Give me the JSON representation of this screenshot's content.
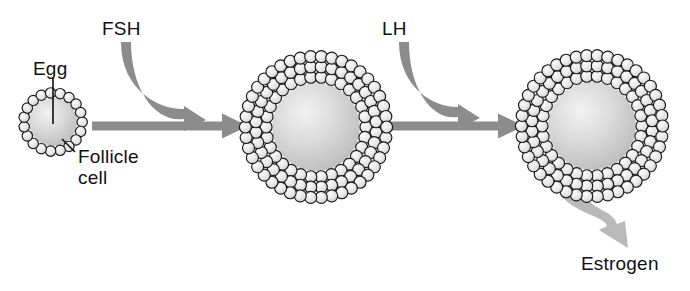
{
  "diagram": {
    "background_color": "#ffffff",
    "text_color": "#111111",
    "arrow_color": "#8c8c8c",
    "hormone_arrow_color": "#8c8c8c",
    "secretion_arrow_color": "#b9b9b9",
    "cell_fill_color": "#e9e9e9",
    "cell_stroke_color": "#1a1a1a",
    "egg_fill_color": "#d2d2d2",
    "labels": {
      "egg": "Egg",
      "fsh": "FSH",
      "lh": "LH",
      "follicle_cell_line1": "Follicle",
      "follicle_cell_line2": "cell",
      "estrogen": "Estrogen"
    },
    "stages": [
      {
        "name": "primary-follicle",
        "center_x": 53,
        "center_y": 122,
        "oocyte_radius": 24,
        "cell_rings": 1,
        "cells_per_ring": 19,
        "cell_radius": 5.2
      },
      {
        "name": "growing-follicle",
        "center_x": 316,
        "center_y": 127,
        "oocyte_radius": 44,
        "cell_rings": 3,
        "cells_per_ring": 30,
        "cell_radius": 6.0
      },
      {
        "name": "mature-follicle",
        "center_x": 592,
        "center_y": 126,
        "oocyte_radius": 44,
        "cell_rings": 3,
        "cells_per_ring": 30,
        "cell_radius": 6.0
      }
    ],
    "flow_arrows": [
      {
        "name": "stage1-to-stage2",
        "from_x": 92,
        "to_x": 248,
        "y": 126
      },
      {
        "name": "stage2-to-stage3",
        "from_x": 376,
        "to_x": 524,
        "y": 126
      }
    ],
    "hormone_arrows": [
      {
        "name": "fsh-arrow",
        "label": "FSH",
        "start_x": 126,
        "start_y": 42,
        "end_x": 206,
        "end_y": 120
      },
      {
        "name": "lh-arrow",
        "label": "LH",
        "start_x": 404,
        "start_y": 42,
        "end_x": 480,
        "end_y": 118
      }
    ],
    "secretion_arrow": {
      "name": "estrogen-arrow",
      "label": "Estrogen",
      "start_x": 570,
      "start_y": 185,
      "end_x": 628,
      "end_y": 248
    },
    "leader_lines": [
      {
        "name": "egg-leader",
        "x1": 53,
        "y1": 78,
        "x2": 53,
        "y2": 124
      },
      {
        "name": "follicle-cell-leader",
        "x1": 75,
        "y1": 152,
        "x2": 62,
        "y2": 139
      }
    ]
  }
}
